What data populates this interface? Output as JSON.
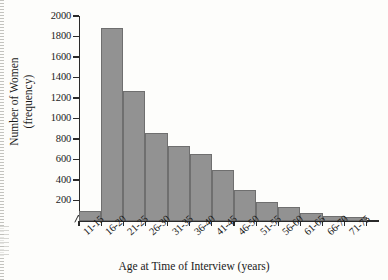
{
  "chart_data": {
    "type": "bar",
    "title": "",
    "subtitle": "",
    "xlabel": "Age at Time of Interview (years)",
    "ylabel_line1": "Number of Women",
    "ylabel_line2": "(frequency)",
    "categories": [
      "11-15",
      "16-20",
      "21-25",
      "26-30",
      "31-35",
      "36-40",
      "41-45",
      "46-50",
      "51-55",
      "56-60",
      "61-65",
      "66-70",
      "71-75"
    ],
    "values": [
      100,
      1880,
      1270,
      855,
      730,
      655,
      495,
      300,
      185,
      140,
      75,
      50,
      40
    ],
    "ylim": [
      0,
      2000
    ],
    "yticks": [
      200,
      400,
      600,
      800,
      1000,
      1200,
      1400,
      1600,
      1800,
      2000
    ],
    "ytick_labels": [
      "200",
      "400",
      "600",
      "800",
      "1000",
      "1200",
      "1400",
      "1600",
      "1800",
      "2000"
    ],
    "grid": false,
    "legend": null,
    "legend_position": "none",
    "bar_color": "#929292",
    "bar_edge_color": "#6f6f6f",
    "axis_color": "#2a2a2a",
    "background_color": "#fdfdfb",
    "annotations": [
      "axis-break-mark-at-origin"
    ]
  },
  "figure": {
    "x_axis_title": "Age at Time of Interview (years)",
    "y_axis_title_line1": "Number of Women",
    "y_axis_title_line2": "(frequency)"
  }
}
